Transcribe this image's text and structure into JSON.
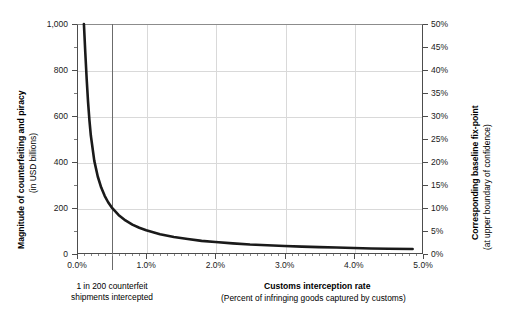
{
  "chart_data": {
    "type": "line",
    "title": "",
    "xlabel": "Customs interception rate",
    "xlabel_sub": "(Percent of infringing goods captured by customs)",
    "ylabel": "Magnitude of counterfeiting and piracy",
    "ylabel_sub": "(in USD billions)",
    "y2label": "Corresponding baseline fix-point",
    "y2label_sub": "(at upper boundary of confidence)",
    "xlim": [
      0.0,
      5.0
    ],
    "ylim": [
      0,
      1000
    ],
    "y2lim": [
      0,
      50
    ],
    "grid": true,
    "legend": "none",
    "x_ticks": [
      "0.0%",
      "1.0%",
      "2.0%",
      "3.0%",
      "4.0%",
      "5.0%"
    ],
    "x_tick_values": [
      0.0,
      1.0,
      2.0,
      3.0,
      4.0,
      5.0
    ],
    "y_ticks": [
      "0",
      "200",
      "400",
      "600",
      "800",
      "1,000"
    ],
    "y_tick_values": [
      0,
      200,
      400,
      600,
      800,
      1000
    ],
    "y2_ticks": [
      "0%",
      "5%",
      "10%",
      "15%",
      "20%",
      "25%",
      "30%",
      "35%",
      "40%",
      "45%",
      "50%"
    ],
    "y2_tick_values": [
      0,
      5,
      10,
      15,
      20,
      25,
      30,
      35,
      40,
      45,
      50
    ],
    "series": [
      {
        "name": "Magnitude of counterfeiting and piracy",
        "color": "#1a1a1a",
        "x": [
          0.1,
          0.12,
          0.14,
          0.16,
          0.18,
          0.2,
          0.25,
          0.3,
          0.35,
          0.4,
          0.45,
          0.5,
          0.6,
          0.7,
          0.8,
          0.9,
          1.0,
          1.2,
          1.4,
          1.6,
          1.8,
          2.0,
          2.25,
          2.5,
          2.75,
          3.0,
          3.25,
          3.5,
          3.75,
          4.0,
          4.25,
          4.5,
          4.85
        ],
        "y": [
          1000,
          875,
          760,
          660,
          580,
          515,
          405,
          337,
          289,
          253,
          225,
          203,
          170,
          146,
          128,
          114,
          103,
          86,
          74,
          65,
          57,
          52,
          46,
          41,
          38,
          35,
          32,
          30,
          28,
          26,
          24,
          23,
          22
        ]
      }
    ],
    "annotations": [
      {
        "name": "marker-line",
        "x": 0.5,
        "line1": "1 in 200 counterfeit",
        "line2": "shipments intercepted"
      }
    ]
  },
  "colors": {
    "curve": "#1a1a1a",
    "axis": "#4d4d4d",
    "grid": "#d9d9d9",
    "marker": "#6b6b6b",
    "background": "#ffffff",
    "text": "#000000"
  }
}
